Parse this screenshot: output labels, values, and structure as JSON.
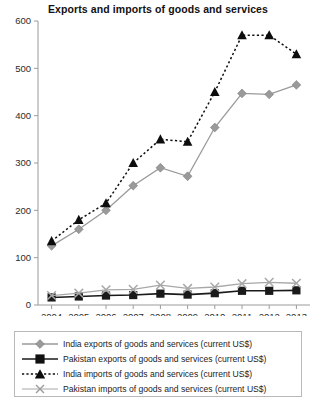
{
  "chart_data": {
    "type": "line",
    "title": "Exports and imports of goods and services",
    "xlabel": "",
    "ylabel": "",
    "categories": [
      "2004",
      "2005",
      "2006",
      "2007",
      "2008",
      "2009",
      "2010",
      "2011",
      "2012",
      "2013"
    ],
    "ylim": [
      0,
      600
    ],
    "yticks": [
      0,
      100,
      200,
      300,
      400,
      500,
      600
    ],
    "grid": false,
    "legend_position": "below",
    "series": [
      {
        "name": "India exports of goods and services (current US$)",
        "marker": "diamond",
        "line_style": "solid",
        "color": "#9a9a9a",
        "values": [
          125,
          160,
          200,
          252,
          290,
          272,
          375,
          447,
          445,
          465
        ]
      },
      {
        "name": "Pakistan exports of goods and services (current US$)",
        "marker": "square",
        "line_style": "solid",
        "color": "#1a1a1a",
        "values": [
          16,
          18,
          20,
          21,
          24,
          22,
          25,
          30,
          30,
          31
        ]
      },
      {
        "name": "India imports of goods and services (current US$)",
        "marker": "triangle",
        "line_style": "dotted",
        "color": "#0d0d0d",
        "values": [
          135,
          180,
          215,
          300,
          350,
          345,
          450,
          570,
          570,
          530
        ]
      },
      {
        "name": "Pakistan imports of goods and services (current US$)",
        "marker": "x",
        "line_style": "solid",
        "color": "#a8a8a8",
        "values": [
          20,
          25,
          32,
          33,
          42,
          35,
          38,
          45,
          48,
          46
        ]
      }
    ]
  },
  "legend": {
    "items": [
      {
        "label": "India exports of goods and services (current US$)"
      },
      {
        "label": "Pakistan exports of goods and services (current US$)"
      },
      {
        "label": "India imports of goods and services (current US$)"
      },
      {
        "label": "Pakistan imports of goods and services (current US$)"
      }
    ]
  }
}
